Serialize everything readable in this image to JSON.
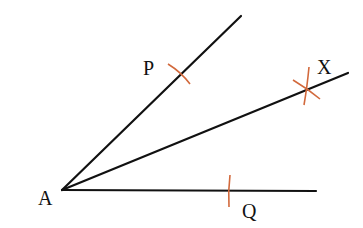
{
  "diagram": {
    "colors": {
      "line": "#111111",
      "arc": "#d2693c",
      "background": "#ffffff"
    },
    "points": [
      {
        "id": "A",
        "label": "A",
        "x": 62,
        "y": 190
      },
      {
        "id": "P",
        "label": "P",
        "x": 181,
        "y": 74
      },
      {
        "id": "Q",
        "label": "Q",
        "x": 229,
        "y": 191
      },
      {
        "id": "X",
        "label": "X",
        "x": 307,
        "y": 89
      }
    ],
    "rays": [
      {
        "from": "A",
        "to": [
          241,
          16
        ],
        "through": "P"
      },
      {
        "from": "A",
        "to": [
          348,
          73
        ],
        "through": "X",
        "role": "bisector"
      },
      {
        "from": "A",
        "to": [
          316,
          191
        ],
        "through": "Q"
      }
    ],
    "arcs": [
      {
        "at": "P",
        "description": "arc mark crossing ray AP"
      },
      {
        "at": "Q",
        "description": "arc mark crossing ray AQ"
      },
      {
        "at": "X",
        "description": "two intersecting arcs"
      }
    ],
    "labels": {
      "A": "A",
      "P": "P",
      "Q": "Q",
      "X": "X"
    }
  }
}
